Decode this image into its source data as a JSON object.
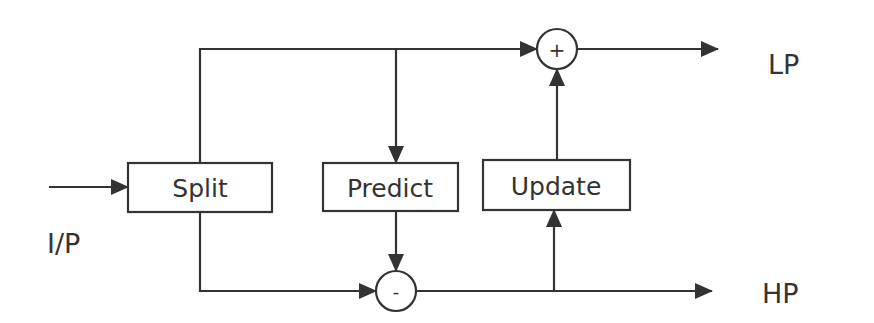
{
  "diagram": {
    "title": "",
    "colors": {
      "stroke": "#333333",
      "background": "#ffffff",
      "text": "#333333"
    },
    "labels": {
      "input": "I/P",
      "output_low": "LP",
      "output_high": "HP"
    },
    "blocks": {
      "split": "Split",
      "predict": "Predict",
      "update": "Update"
    },
    "operators": {
      "adder": "+",
      "subtractor": "-"
    },
    "edges": [
      {
        "from": "I/P",
        "to": "Split"
      },
      {
        "from": "Split",
        "to": "+ (top path)"
      },
      {
        "from": "Split (top path)",
        "to": "Predict"
      },
      {
        "from": "Split",
        "to": "- (bottom path)"
      },
      {
        "from": "Predict",
        "to": "-"
      },
      {
        "from": "- (bottom path)",
        "to": "Update"
      },
      {
        "from": "Update",
        "to": "+"
      },
      {
        "from": "+",
        "to": "LP"
      },
      {
        "from": "-",
        "to": "HP"
      }
    ]
  }
}
